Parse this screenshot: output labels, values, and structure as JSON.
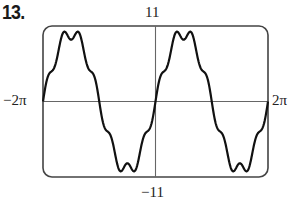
{
  "problem": {
    "number": "13."
  },
  "axes": {
    "y_max_label": "11",
    "y_min_label": "−11",
    "x_min_label": "−2π",
    "x_max_label": "2π"
  },
  "chart_data": {
    "type": "line",
    "title": "",
    "xlabel": "",
    "ylabel": "",
    "xlim": [
      -6.2832,
      6.2832
    ],
    "ylim": [
      -11,
      11
    ],
    "x_tick_labels": [
      "−2π",
      "2π"
    ],
    "y_tick_labels": [
      "11",
      "−11"
    ],
    "grid": false,
    "legend": null,
    "frame": "rounded-rectangle viewing window",
    "function_estimate": "y = 10 sin(x) + sin(7x)",
    "series": [
      {
        "name": "f(x)",
        "x": [
          -6.283,
          -5.655,
          -5.027,
          -4.712,
          -4.398,
          -3.77,
          -3.142,
          -2.513,
          -1.885,
          -1.571,
          -1.257,
          -0.628,
          0,
          0.628,
          1.257,
          1.571,
          1.885,
          2.513,
          3.142,
          3.77,
          4.398,
          4.712,
          5.027,
          5.655,
          6.283
        ],
        "values": [
          0,
          6.1,
          10.5,
          9.0,
          10.5,
          6.1,
          0,
          -6.1,
          -10.5,
          -9.0,
          -10.5,
          -6.1,
          0,
          6.1,
          10.5,
          9.0,
          10.5,
          6.1,
          0,
          -6.1,
          -10.5,
          -9.0,
          -10.5,
          -6.1,
          0
        ]
      }
    ]
  }
}
